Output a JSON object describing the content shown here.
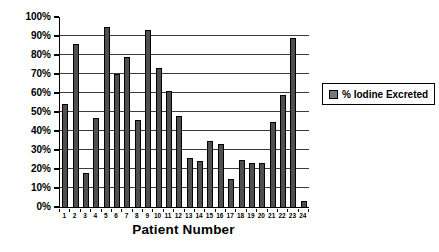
{
  "chart_data": {
    "type": "bar",
    "title": "",
    "xlabel": "Patient Number",
    "ylabel": "",
    "categories": [
      "1",
      "2",
      "3",
      "4",
      "5",
      "6",
      "7",
      "8",
      "9",
      "10",
      "11",
      "12",
      "13",
      "14",
      "15",
      "16",
      "17",
      "18",
      "19",
      "20",
      "21",
      "22",
      "23",
      "24"
    ],
    "series": [
      {
        "name": "% Iodine Excreted",
        "values": [
          54,
          86,
          18,
          47,
          95,
          70,
          79,
          46,
          93,
          73,
          61,
          48,
          26,
          24,
          35,
          33,
          15,
          25,
          23,
          23,
          45,
          59,
          89,
          3
        ]
      }
    ],
    "ylim": [
      0,
      100
    ],
    "yticks": [
      {
        "label": "0%",
        "value": 0
      },
      {
        "label": "10%",
        "value": 10
      },
      {
        "label": "20%",
        "value": 20
      },
      {
        "label": "30%",
        "value": 30
      },
      {
        "label": "40%",
        "value": 40
      },
      {
        "label": "50%",
        "value": 50
      },
      {
        "label": "60%",
        "value": 60
      },
      {
        "label": "70%",
        "value": 70
      },
      {
        "label": "80%",
        "value": 80
      },
      {
        "label": "90%",
        "value": 90
      },
      {
        "label": "100%",
        "value": 100
      }
    ],
    "gridlines": [
      10,
      20,
      30,
      40,
      50,
      60,
      70,
      80,
      90
    ],
    "grid": true,
    "legend_position": "right"
  },
  "legend": {
    "label": "% Iodine Excreted"
  },
  "colors": {
    "background": "#ffffff",
    "plot_background": "#ffffff",
    "bar_fill": "#4f4f4f",
    "bar_border": "#000000",
    "grid_line": "#3c3c3c",
    "axis_line": "#000000",
    "legend_marker_fill": "#787878"
  }
}
